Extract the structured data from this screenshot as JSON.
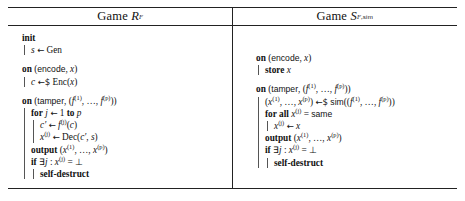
{
  "figure": {
    "type": "two-column-pseudocode-figure",
    "panels": [
      {
        "id": "left",
        "title_prefix": "Game",
        "title_symbol": "R",
        "title_subscript": "F",
        "title_full": "Game R_F",
        "blocks": [
          {
            "header": "init",
            "header_keyword": "init",
            "lines": [
              {
                "text": "s ← Gen",
                "indent": 1
              }
            ]
          },
          {
            "header": "on (encode, x)",
            "header_keyword": "on",
            "header_args": "(encode, x)",
            "lines": [
              {
                "text": "c ←$ Enc(x)",
                "indent": 1
              }
            ]
          },
          {
            "header": "on (tamper, (f^(1), …, f^(p)))",
            "header_keyword": "on",
            "header_args": "(tamper, (f^(1), …, f^(p)))",
            "lines": [
              {
                "text": "for j ← 1 to p",
                "indent": 1,
                "keyword": "for"
              },
              {
                "text": "c′ ← f^(j)(c)",
                "indent": 2
              },
              {
                "text": "x^(j) ← Dec(c′, s)",
                "indent": 2
              },
              {
                "text": "output (x^(1), …, x^(p))",
                "indent": 1,
                "keyword": "output"
              },
              {
                "text": "if ∃j : x^(j) = ⊥",
                "indent": 1,
                "keyword": "if"
              },
              {
                "text": "self-destruct",
                "indent": 2,
                "keyword": "self-destruct"
              }
            ]
          }
        ]
      },
      {
        "id": "right",
        "title_prefix": "Game",
        "title_symbol": "S",
        "title_subscript": "F,sim",
        "title_full": "Game S_{F,sim}",
        "blocks": [
          {
            "header": "on (encode, x)",
            "header_keyword": "on",
            "header_args": "(encode, x)",
            "lines": [
              {
                "text": "store x",
                "indent": 1,
                "keyword": "store"
              }
            ]
          },
          {
            "header": "on (tamper, (f^(1), …, f^(p)))",
            "header_keyword": "on",
            "header_args": "(tamper, (f^(1), …, f^(p)))",
            "lines": [
              {
                "text": "(x^(1), …, x^(p)) ←$ sim((f^(1), …, f^(p)))",
                "indent": 1
              },
              {
                "text": "for all x^(j) = same",
                "indent": 1,
                "keyword": "for all"
              },
              {
                "text": "x^(j) ← x",
                "indent": 2
              },
              {
                "text": "output (x^(1), …, x^(p))",
                "indent": 1,
                "keyword": "output"
              },
              {
                "text": "if ∃j : x^(j) = ⊥",
                "indent": 1,
                "keyword": "if"
              },
              {
                "text": "self-destruct",
                "indent": 2,
                "keyword": "self-destruct"
              }
            ]
          }
        ]
      }
    ]
  },
  "tokens": {
    "game": "Game",
    "init": "init",
    "on": "on",
    "encode": "encode",
    "tamper": "tamper",
    "store": "store",
    "for": "for",
    "for_all": "for all",
    "to": "to",
    "output": "output",
    "if": "if",
    "self_destruct": "self-destruct",
    "gen": "Gen",
    "enc": "Enc",
    "dec": "Dec",
    "sim": "sim",
    "same": "same",
    "bot": "⊥",
    "exists": "∃",
    "arrow": "←",
    "rand_arrow": "←$",
    "ellipsis": "…",
    "x": "x",
    "s": "s",
    "c": "c",
    "cprime": "c′",
    "j": "j",
    "p": "p",
    "f": "f",
    "R": "R",
    "S": "S",
    "F": "F",
    "subsim": "sim",
    "sup1": "(1)",
    "supp": "(p)",
    "supj": "(j)",
    "one": "1",
    "eq": "=",
    "colon": ":"
  },
  "colors": {
    "text": "#111111",
    "rule": "#222222",
    "guide": "#555555",
    "background": "#ffffff"
  }
}
